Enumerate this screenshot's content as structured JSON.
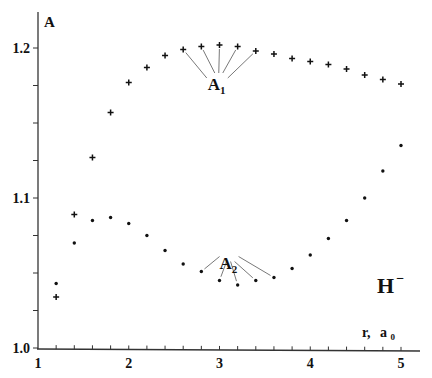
{
  "chart_data": {
    "type": "scatter",
    "title": "",
    "xlabel": "r,  a0",
    "xlabel_main": "r,",
    "xlabel_unit": "a",
    "xlabel_unit_sub": "0",
    "ylabel": "A",
    "xlim": [
      1,
      5.2
    ],
    "ylim": [
      1.0,
      1.22
    ],
    "x_ticks": [
      1,
      2,
      3,
      4,
      5
    ],
    "x_tick_labels": [
      "1",
      "2",
      "3",
      "4",
      "5"
    ],
    "x_minor_step": 0.2,
    "y_ticks": [
      1.0,
      1.1,
      1.2
    ],
    "y_tick_labels": [
      "1.0",
      "1.1",
      "1.2"
    ],
    "y_minor_step": 0.025,
    "grid": false,
    "annotation_species": "H",
    "annotation_species_sup": "−",
    "series": [
      {
        "name": "A1",
        "label_main": "A",
        "label_sub": "1",
        "marker": "plus",
        "x": [
          1.2,
          1.4,
          1.6,
          1.8,
          2.0,
          2.2,
          2.4,
          2.6,
          2.8,
          3.0,
          3.2,
          3.4,
          3.6,
          3.8,
          4.0,
          4.2,
          4.4,
          4.6,
          4.8,
          5.0
        ],
        "y": [
          1.034,
          1.089,
          1.127,
          1.157,
          1.177,
          1.187,
          1.195,
          1.199,
          1.201,
          1.202,
          1.201,
          1.198,
          1.196,
          1.193,
          1.191,
          1.189,
          1.186,
          1.182,
          1.179,
          1.176
        ]
      },
      {
        "name": "A2",
        "label_main": "A",
        "label_sub": "2",
        "marker": "dot",
        "x": [
          1.2,
          1.4,
          1.6,
          1.8,
          2.0,
          2.2,
          2.4,
          2.6,
          2.8,
          3.0,
          3.2,
          3.4,
          3.6,
          3.8,
          4.0,
          4.2,
          4.4,
          4.6,
          4.8,
          5.0
        ],
        "y": [
          1.043,
          1.07,
          1.085,
          1.087,
          1.083,
          1.075,
          1.065,
          1.056,
          1.051,
          1.045,
          1.042,
          1.045,
          1.047,
          1.053,
          1.062,
          1.073,
          1.085,
          1.1,
          1.118,
          1.135
        ]
      }
    ],
    "annotations": [
      {
        "text": "A1",
        "series": "A1",
        "points": [
          2.6,
          2.8,
          3.0,
          3.2,
          3.4
        ],
        "label_x": 2.97,
        "label_y": 1.176
      },
      {
        "text": "A2",
        "series": "A2",
        "points": [
          2.8,
          3.0,
          3.2,
          3.4,
          3.6
        ],
        "label_x": 3.1,
        "label_y": 1.057
      }
    ]
  }
}
